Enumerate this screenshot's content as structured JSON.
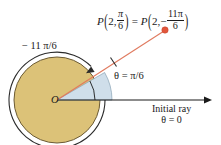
{
  "figure": {
    "background_color": "#ffffff"
  },
  "colors": {
    "disk_fill": "#dcc278",
    "disk_stroke": "#6b5a33",
    "sector_fill": "#cfdeea",
    "sector_stroke": "#8aa3b5",
    "ray_red": "#e07a5f",
    "point_red": "#e2563c",
    "axis_black": "#1a1a1a",
    "text": "#1a1a1a",
    "arc_arrow": "#2b2b2b"
  },
  "geometry": {
    "origin": {
      "x": 57,
      "y": 100,
      "label": "O"
    },
    "disk_radius": 43,
    "sector_radius": 55,
    "angle_degrees": 30,
    "angle_label_radius": 38,
    "point": {
      "x": 165,
      "y": 30,
      "radius_px": 3.2
    },
    "tick_mark": {
      "x": 113,
      "y": 62
    },
    "axis_end_x": 212,
    "arc_arrow_radius": 48,
    "arc_arrow_head": {
      "x": 88,
      "y": 72
    }
  },
  "labels": {
    "point_equation": {
      "name": "P",
      "left_radius": "2",
      "left_angle_numerator": "π",
      "left_angle_denominator": "6",
      "equals": "=",
      "right_radius": "2",
      "right_angle_sign": "−",
      "right_angle_numerator": "11π",
      "right_angle_denominator": "6",
      "open_paren": "(",
      "close_paren": ")",
      "comma": ",",
      "plain_text": "P(2, π/6) = P(2, −11π/6)"
    },
    "arc_angle": "− 11 π/6",
    "theta_angle": "θ = π/6",
    "origin": "O",
    "initial_ray_line1": "Initial ray",
    "initial_ray_line2": "θ = 0"
  }
}
